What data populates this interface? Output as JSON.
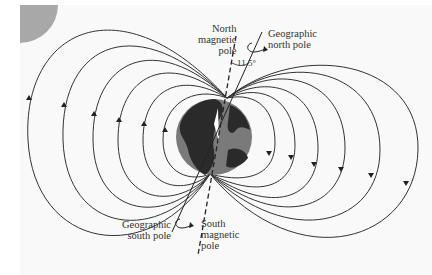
{
  "diagram": {
    "labels": {
      "north_magnetic_pole": [
        "North",
        "magnetic",
        "pole"
      ],
      "geographic_north_pole": [
        "Geographic",
        "north pole"
      ],
      "angle": "11.5°",
      "geographic_south_pole": [
        "Geographic",
        "south pole"
      ],
      "south_magnetic_pole": [
        "South",
        "magnetic",
        "pole"
      ]
    },
    "field_lines": {
      "count_per_side": 6,
      "left_arrow_direction": "up",
      "right_arrow_direction": "down"
    },
    "colors": {
      "line": "#333333",
      "globe_land": "#2a2a2a",
      "globe_ocean": "#7a7a7a",
      "corner_shape": "#a8a8a8",
      "panel_bg": "#f9f9f9"
    }
  }
}
